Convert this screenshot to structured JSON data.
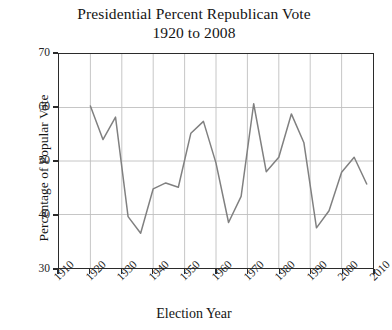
{
  "chart_data": {
    "type": "line",
    "title": "Presidential Percent Republican Vote",
    "subtitle": "1920 to 2008",
    "title_line1": "Presidential Percent Republican Vote",
    "title_line2": "1920 to 2008",
    "xlabel": "Election Year",
    "ylabel": "Percentage of Popular Vote",
    "xlim": [
      1910,
      2010
    ],
    "ylim": [
      30,
      70
    ],
    "xticks": [
      1910,
      1920,
      1930,
      1940,
      1950,
      1960,
      1970,
      1980,
      1990,
      2000,
      2010
    ],
    "yticks": [
      30,
      40,
      50,
      60,
      70
    ],
    "xtick_labels": [
      "1910",
      "1920",
      "1930",
      "1940",
      "1950",
      "1960",
      "1970",
      "1980",
      "1990",
      "2000",
      "2010"
    ],
    "ytick_labels": [
      "30",
      "40",
      "50",
      "60",
      "70"
    ],
    "grid": true,
    "legend": null,
    "line_color": "#808080",
    "grid_color": "#bfbfbf",
    "frame_color": "#2b2b2b",
    "x": [
      1920,
      1924,
      1928,
      1932,
      1936,
      1940,
      1944,
      1948,
      1952,
      1956,
      1960,
      1964,
      1968,
      1972,
      1976,
      1980,
      1984,
      1988,
      1992,
      1996,
      2000,
      2004,
      2008
    ],
    "values": [
      60.3,
      54.0,
      58.2,
      39.6,
      36.5,
      44.8,
      45.9,
      45.1,
      55.2,
      57.4,
      49.6,
      38.5,
      43.4,
      60.7,
      48.0,
      50.7,
      58.8,
      53.4,
      37.5,
      40.7,
      47.9,
      50.7,
      45.7
    ],
    "series": [
      {
        "name": "Percent Republican Vote",
        "values": [
          60.3,
          54.0,
          58.2,
          39.6,
          36.5,
          44.8,
          45.9,
          45.1,
          55.2,
          57.4,
          49.6,
          38.5,
          43.4,
          60.7,
          48.0,
          50.7,
          58.8,
          53.4,
          37.5,
          40.7,
          47.9,
          50.7,
          45.7
        ]
      }
    ]
  }
}
